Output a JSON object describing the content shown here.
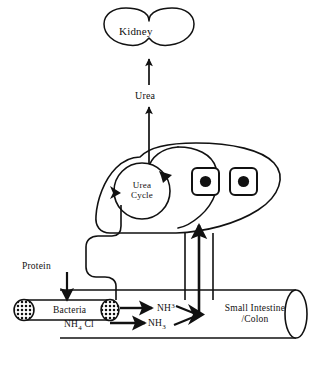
{
  "diagram": {
    "stroke_color": "#111111",
    "fill_color": "#ffffff",
    "background": "#ffffff"
  },
  "organs": {
    "kidney": {
      "label": "Kidney",
      "shape": "kidney-bean-ellipse"
    },
    "liver": {
      "shape": "liver-lobe-outline"
    },
    "intestine": {
      "label_line1": "Small Intestine",
      "label_line2": "/Colon",
      "shape": "open-ended-cylinder"
    },
    "bacteria_tube": {
      "label": "Bacteria",
      "shape": "capsule-with-hatched-ends"
    }
  },
  "processes": {
    "urea_cycle": {
      "label_line1": "Urea",
      "label_line2": "Cycle",
      "shape": "circle-with-arrowheads"
    }
  },
  "metabolites": {
    "urea": "Urea",
    "protein": "Protein",
    "ammonia_upper": {
      "formula": "NH",
      "subscript": "3"
    },
    "ammonia_lower": {
      "formula": "NH",
      "subscript": "3"
    },
    "ammonium_chloride": {
      "prefix": "NH",
      "subscript": "4",
      "suffix": "Cl"
    }
  },
  "flows": [
    {
      "name": "protein-into-bacteria",
      "from": "Protein",
      "to": "Bacteria",
      "direction": "down"
    },
    {
      "name": "bacteria-to-ammonia",
      "from": "Bacteria",
      "to": "NH3",
      "direction": "right"
    },
    {
      "name": "nh4cl-to-ammonia",
      "from": "NH4Cl",
      "to": "NH3",
      "direction": "right"
    },
    {
      "name": "ammonia-to-portal",
      "from": "NH3",
      "to": "portal vein",
      "direction": "right"
    },
    {
      "name": "portal-to-liver",
      "from": "intestine",
      "to": "liver",
      "direction": "up"
    },
    {
      "name": "into-urea-cycle",
      "from": "portal blood",
      "to": "Urea Cycle",
      "direction": "into-circle"
    },
    {
      "name": "liver-to-urea",
      "from": "liver",
      "to": "Urea",
      "direction": "up"
    },
    {
      "name": "urea-to-kidney",
      "from": "Urea",
      "to": "Kidney",
      "direction": "up"
    }
  ]
}
